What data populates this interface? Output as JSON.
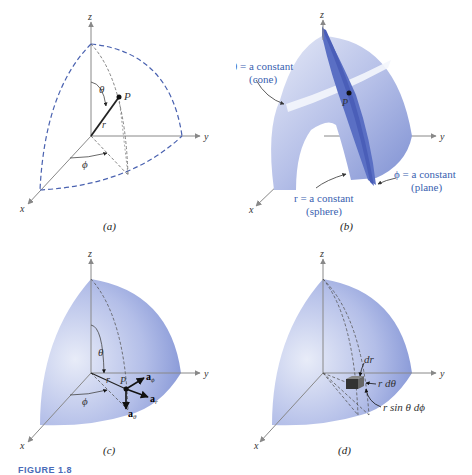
{
  "figure": {
    "caption_label": "FIGURE 1.8"
  },
  "panels": {
    "a": {
      "caption": "(a)",
      "axes": {
        "x": "x",
        "y": "y",
        "z": "z"
      },
      "labels": {
        "theta": "θ",
        "phi": "ϕ",
        "r": "r",
        "point": "P"
      }
    },
    "b": {
      "caption": "(b)",
      "axes": {
        "x": "x",
        "y": "y",
        "z": "z"
      },
      "labels": {
        "point": "P",
        "cone_line1": "θ = a constant",
        "cone_line2": "(cone)",
        "sphere_line1": "r = a constant",
        "sphere_line2": "(sphere)",
        "plane_line1": "ϕ = a constant",
        "plane_line2": "(plane)"
      }
    },
    "c": {
      "caption": "(c)",
      "axes": {
        "x": "x",
        "y": "y",
        "z": "z"
      },
      "labels": {
        "theta": "θ",
        "phi": "ϕ",
        "r": "r",
        "point": "P",
        "a_phi": "a",
        "a_phi_sub": "ϕ",
        "a_r": "a",
        "a_r_sub": "r",
        "a_theta": "a",
        "a_theta_sub": "θ"
      }
    },
    "d": {
      "caption": "(d)",
      "axes": {
        "x": "x",
        "y": "y",
        "z": "z"
      },
      "labels": {
        "dr": "dr",
        "r_dtheta": "r dθ",
        "r_sin_dphi": "r sin θ dϕ"
      }
    }
  },
  "colors": {
    "surface_light": "#dfe4f5",
    "surface_mid": "#a8b4e4",
    "surface_dark": "#6f82cc",
    "plane": "#5a6fc4",
    "dashed": "#4a62b0",
    "axis": "#888888",
    "label_blue": "#3a5fb0"
  }
}
